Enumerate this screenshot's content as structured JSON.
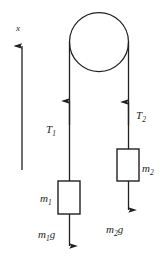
{
  "figure": {
    "type": "physics-diagram",
    "width": 165,
    "height": 258,
    "background_color": "#ffffff",
    "stroke_color": "#231f20"
  },
  "axis": {
    "label": "x",
    "direction": "up",
    "arrow_tip_y": 45,
    "arrow_tail_y": 170,
    "x_position": 22
  },
  "pulley": {
    "name": "pulley",
    "center_x": 99,
    "center_y": 42,
    "radius": 29.5
  },
  "ropes": {
    "left": {
      "tension_label": "T",
      "tension_subscript": "1",
      "x": 69.5,
      "top_y": 42,
      "bottom_y": 181,
      "arrow_direction": "up",
      "arrow_tip_y": 100
    },
    "right": {
      "tension_label": "T",
      "tension_subscript": "2",
      "x": 128.5,
      "top_y": 42,
      "bottom_y": 149,
      "arrow_direction": "up",
      "arrow_tip_y": 101
    }
  },
  "blocks": [
    {
      "name": "block-m1",
      "mass_label": "m",
      "mass_subscript": "1",
      "label_side": "left",
      "x": 58,
      "y": 181,
      "width": 22,
      "height": 33
    },
    {
      "name": "block-m2",
      "mass_label": "m",
      "mass_subscript": "2",
      "label_side": "right",
      "x": 117,
      "y": 149,
      "width": 22,
      "height": 32
    }
  ],
  "weights": [
    {
      "name": "weight-m1g",
      "label": "m",
      "subscript": "1",
      "suffix": "g",
      "arrow_from_y": 214,
      "arrow_to_y": 251,
      "x": 69.5,
      "label_x": 47,
      "label_y": 236
    },
    {
      "name": "weight-m2g",
      "label": "m",
      "subscript": "2",
      "suffix": "g",
      "arrow_from_y": 181,
      "arrow_to_y": 215,
      "x": 128.5,
      "label_x": 116,
      "label_y": 232
    }
  ]
}
